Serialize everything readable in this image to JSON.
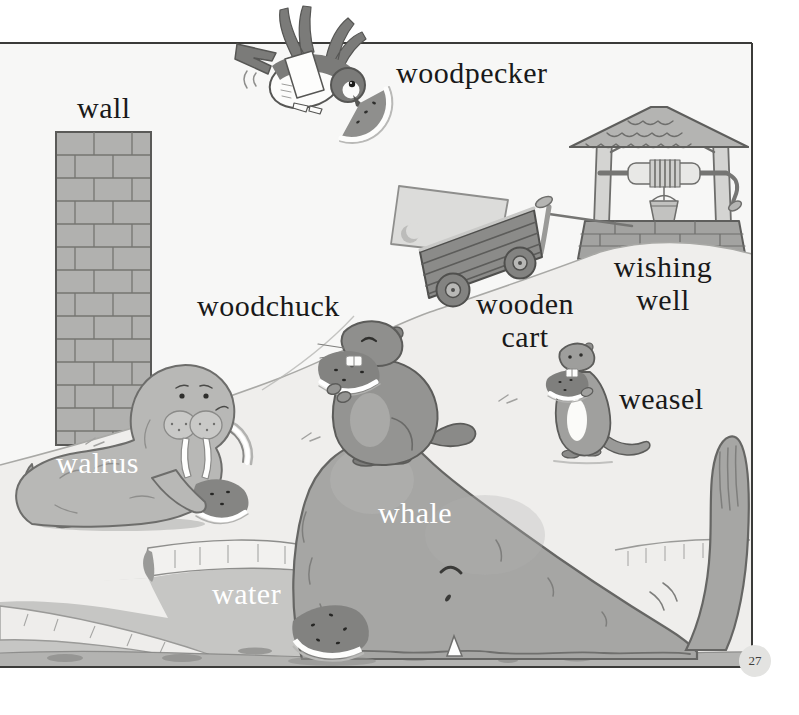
{
  "page": {
    "number": "27"
  },
  "labels": {
    "wall": "wall",
    "woodpecker": "woodpecker",
    "woodchuck": "woodchuck",
    "wooden_cart": {
      "line1": "wooden",
      "line2": "cart"
    },
    "wishing_well": {
      "line1": "wishing",
      "line2": "well"
    },
    "weasel": "weasel",
    "walrus": "walrus",
    "whale": "whale",
    "water": "water"
  },
  "scene_objects": [
    "brick wall",
    "woodpecker with watermelon slice",
    "wooden cart",
    "slab with crescent",
    "wishing well",
    "woodchuck eating watermelon",
    "weasel eating watermelon",
    "walrus with watermelon",
    "whale",
    "water pond",
    "watermelon slice on ground"
  ],
  "colors": {
    "paper": "#ffffff",
    "ink": "#191919",
    "light_label": "#ffffff",
    "border": "#3b3b39",
    "sky": "#f7f7f6",
    "hill": "#efeeec",
    "whale_gray": "#a6a6a4",
    "water_gray": "#c6c6c4",
    "ground_gray": "#b3b3b1"
  }
}
